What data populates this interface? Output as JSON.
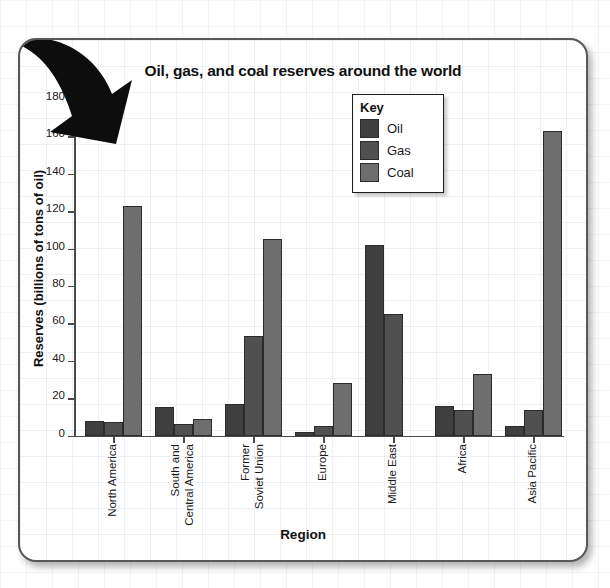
{
  "chart_data": {
    "type": "bar",
    "title": "Oil, gas, and coal reserves around the world",
    "xlabel": "Region",
    "ylabel": "Reserves (billions of tons of oil)",
    "ylim": [
      0,
      180
    ],
    "yticks": [
      0,
      20,
      40,
      60,
      80,
      100,
      120,
      140,
      160,
      180
    ],
    "grid": true,
    "legend_position": "upper-center",
    "legend_title": "Key",
    "categories": [
      "North America",
      "South and\nCentral America",
      "Former\nSoviet Union",
      "Europe",
      "Middle East",
      "Africa",
      "Asia Pacific"
    ],
    "series": [
      {
        "name": "Oil",
        "color": "#3f3f3f",
        "values": [
          8,
          15,
          17,
          2,
          102,
          16,
          5
        ]
      },
      {
        "name": "Gas",
        "color": "#505050",
        "values": [
          7,
          6,
          53,
          5,
          65,
          13.5,
          13.5
        ]
      },
      {
        "name": "Coal",
        "color": "#6e6e6e",
        "values": [
          123,
          9,
          105,
          28,
          0,
          33,
          163
        ]
      }
    ]
  },
  "panel": {
    "border_color": "#58585a",
    "background": "#ffffff"
  },
  "decoration": {
    "arrow_icon": "down-left-arrow-icon",
    "arrow_color": "#111111"
  }
}
